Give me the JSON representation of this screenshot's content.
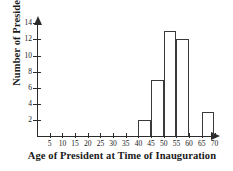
{
  "chart_data": {
    "type": "bar",
    "title": "",
    "xlabel": "Age of President at Time of Inauguration",
    "ylabel": "Number of Presidents",
    "bin_width": 5,
    "bins": [
      {
        "label": "40-45",
        "start": 40,
        "end": 45,
        "value": 2
      },
      {
        "label": "45-50",
        "start": 45,
        "end": 50,
        "value": 7
      },
      {
        "label": "50-55",
        "start": 50,
        "end": 55,
        "value": 13
      },
      {
        "label": "55-60",
        "start": 55,
        "end": 60,
        "value": 12
      },
      {
        "label": "60-65",
        "start": 60,
        "end": 65,
        "value": 0
      },
      {
        "label": "65-70",
        "start": 65,
        "end": 70,
        "value": 3
      }
    ],
    "categories": [
      "40-45",
      "45-50",
      "50-55",
      "55-60",
      "60-65",
      "65-70"
    ],
    "values": [
      2,
      7,
      13,
      12,
      0,
      3
    ],
    "xlim": [
      0,
      72
    ],
    "ylim": [
      0,
      14.6
    ],
    "xticks": [
      5,
      10,
      15,
      20,
      25,
      30,
      35,
      40,
      45,
      50,
      55,
      60,
      65,
      70
    ],
    "yticks": [
      2,
      4,
      6,
      8,
      10,
      12,
      14
    ],
    "grid": false,
    "legend": false,
    "legend_position": "none",
    "bar_fill": "#ffffff",
    "bar_stroke": "#3a3a3a",
    "axis_color": "#2b2b2b",
    "background": "#ffffff"
  },
  "axes": {
    "y_title": "Number of Presidents",
    "x_title": "Age of President at Time of Inauguration"
  }
}
